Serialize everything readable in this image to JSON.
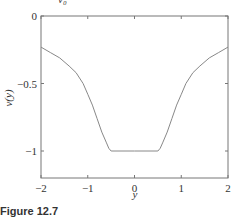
{
  "figure": {
    "caption": "Figure 12.7",
    "top_label": "v₀"
  },
  "chart_data": {
    "type": "line",
    "title": "",
    "xlabel": "y",
    "ylabel": "v(y)",
    "xlim": [
      -2,
      2
    ],
    "ylim": [
      -1.2,
      0
    ],
    "xticks": [
      -2,
      -1,
      0,
      1,
      2
    ],
    "xtick_labels": [
      "−2",
      "−1",
      "0",
      "1",
      "2"
    ],
    "yticks": [
      0,
      -0.5,
      -1
    ],
    "ytick_labels": [
      "0",
      "−0.5",
      "−1"
    ],
    "grid": false,
    "legend": null,
    "series": [
      {
        "name": "v(y)",
        "color": "#888888",
        "x": [
          -2.0,
          -1.8,
          -1.6,
          -1.4,
          -1.25,
          -1.1,
          -1.0,
          -0.9,
          -0.8,
          -0.7,
          -0.6,
          -0.55,
          -0.5,
          0.0,
          0.5,
          0.55,
          0.6,
          0.7,
          0.8,
          0.9,
          1.0,
          1.1,
          1.25,
          1.4,
          1.6,
          1.8,
          2.0
        ],
        "y": [
          -0.23,
          -0.27,
          -0.31,
          -0.37,
          -0.42,
          -0.5,
          -0.58,
          -0.66,
          -0.76,
          -0.86,
          -0.94,
          -0.98,
          -1.0,
          -1.0,
          -1.0,
          -0.98,
          -0.94,
          -0.86,
          -0.76,
          -0.66,
          -0.58,
          -0.5,
          -0.42,
          -0.37,
          -0.31,
          -0.27,
          -0.23
        ]
      }
    ]
  }
}
